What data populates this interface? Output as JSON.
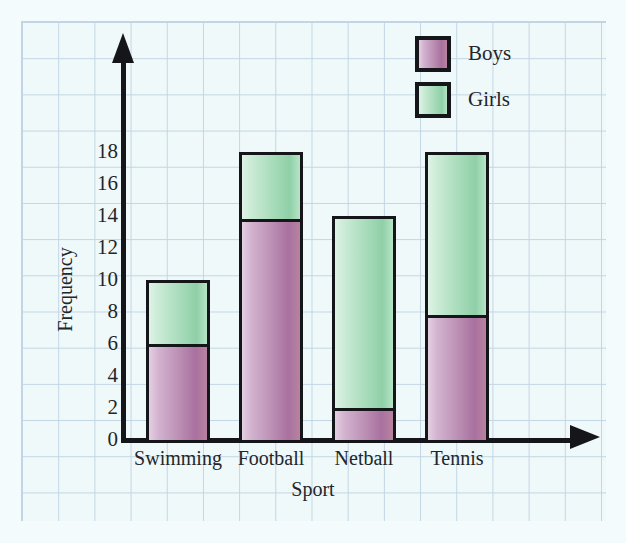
{
  "chart_data": {
    "type": "bar",
    "subtype": "stacked",
    "title": "",
    "xlabel": "Sport",
    "ylabel": "Frequency",
    "categories": [
      "Swimming",
      "Football",
      "Netball",
      "Tennis"
    ],
    "series": [
      {
        "name": "Boys",
        "color": "#bb8fb4",
        "values": [
          6,
          13.8,
          2,
          7.8
        ]
      },
      {
        "name": "Girls",
        "color": "#a9dcbb",
        "values": [
          4,
          4.2,
          12,
          10.2
        ]
      }
    ],
    "totals": [
      10,
      18,
      14,
      18
    ],
    "ylim": [
      0,
      18
    ],
    "yticks": [
      0,
      2,
      4,
      6,
      8,
      10,
      12,
      14,
      16,
      18
    ],
    "ytick_labels": [
      "0",
      "2",
      "4",
      "6",
      "8",
      "10",
      "12",
      "14",
      "16",
      "18"
    ],
    "grid": true,
    "grid_style": "graph-paper",
    "legend_position": "top-right",
    "legend": [
      {
        "label": "Boys",
        "color": "#bb8fb4"
      },
      {
        "label": "Girls",
        "color": "#a9dcbb"
      }
    ],
    "axis_arrows": true,
    "axis_color": "#15161a",
    "background_color": "#f0f9fa",
    "gridline_color": "#b9cfe0"
  },
  "axes": {
    "y_title": "Frequency",
    "x_title": "Sport",
    "y_ticks": [
      {
        "label": "18",
        "value": 18
      },
      {
        "label": "16",
        "value": 16
      },
      {
        "label": "14",
        "value": 14
      },
      {
        "label": "12",
        "value": 12
      },
      {
        "label": "10",
        "value": 10
      },
      {
        "label": "8",
        "value": 8
      },
      {
        "label": "6",
        "value": 6
      },
      {
        "label": "4",
        "value": 4
      },
      {
        "label": "2",
        "value": 2
      },
      {
        "label": "0",
        "value": 0
      }
    ],
    "x_labels": [
      "Swimming",
      "Football",
      "Netball",
      "Tennis"
    ]
  },
  "legend": {
    "boys_label": "Boys",
    "girls_label": "Girls"
  },
  "icons": {
    "y_axis_arrow": "arrow-up-icon",
    "x_axis_arrow": "arrow-right-icon"
  }
}
